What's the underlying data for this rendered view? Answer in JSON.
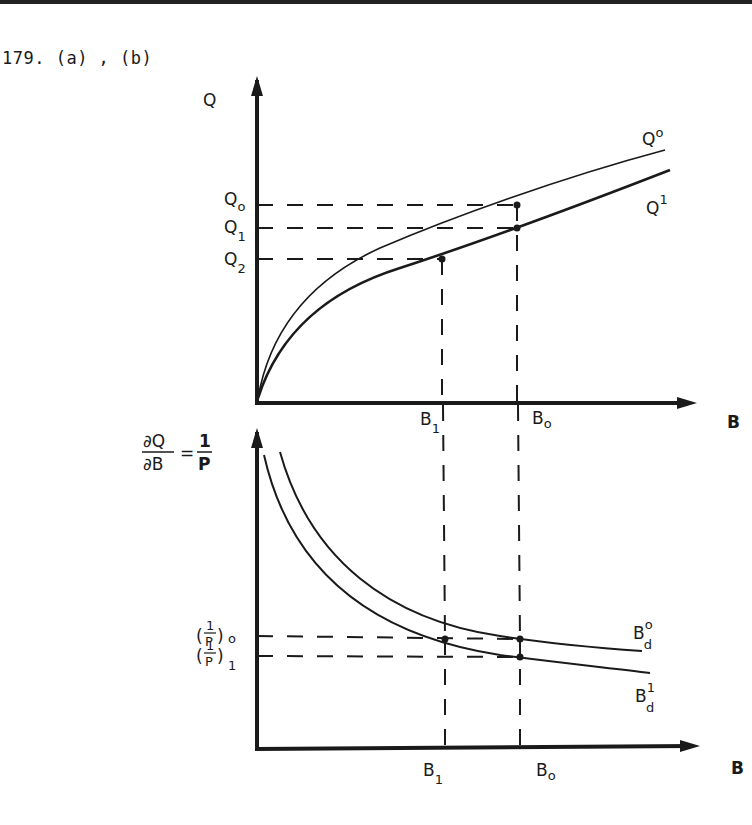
{
  "heading": "179. (a) , (b)",
  "colors": {
    "ink": "#1a1a1a",
    "rule": "#222222",
    "background": "#ffffff"
  },
  "top_panel": {
    "y_axis_label": "Q",
    "x_axis_label": "B",
    "curves": [
      {
        "name": "Q",
        "sup": "o",
        "style": "thin"
      },
      {
        "name": "Q",
        "sup": "1",
        "style": "thick"
      }
    ],
    "y_marks": [
      {
        "name": "Q",
        "sub": "o"
      },
      {
        "name": "Q",
        "sub": "1"
      },
      {
        "name": "Q",
        "sub": "2"
      }
    ],
    "x_marks": [
      {
        "name": "B",
        "sub": "1"
      },
      {
        "name": "B",
        "sub": "o"
      }
    ]
  },
  "bottom_panel": {
    "y_axis_label": {
      "numerator": "∂Q",
      "denominator": "∂B",
      "equals": "=",
      "rhs_num": "1",
      "rhs_den": "P"
    },
    "x_axis_label": "B",
    "curves": [
      {
        "name": "B",
        "sup": "o",
        "sub": "d",
        "style": "thin"
      },
      {
        "name": "B",
        "sup": "1",
        "sub": "d",
        "style": "thin"
      }
    ],
    "y_marks": [
      {
        "open": "(",
        "num": "1",
        "den": "P",
        "close": ")",
        "sub": "o"
      },
      {
        "open": "(",
        "num": "1",
        "den": "P",
        "close": ")",
        "sub": "1"
      }
    ],
    "x_marks": [
      {
        "name": "B",
        "sub": "1"
      },
      {
        "name": "B",
        "sub": "o"
      }
    ]
  }
}
